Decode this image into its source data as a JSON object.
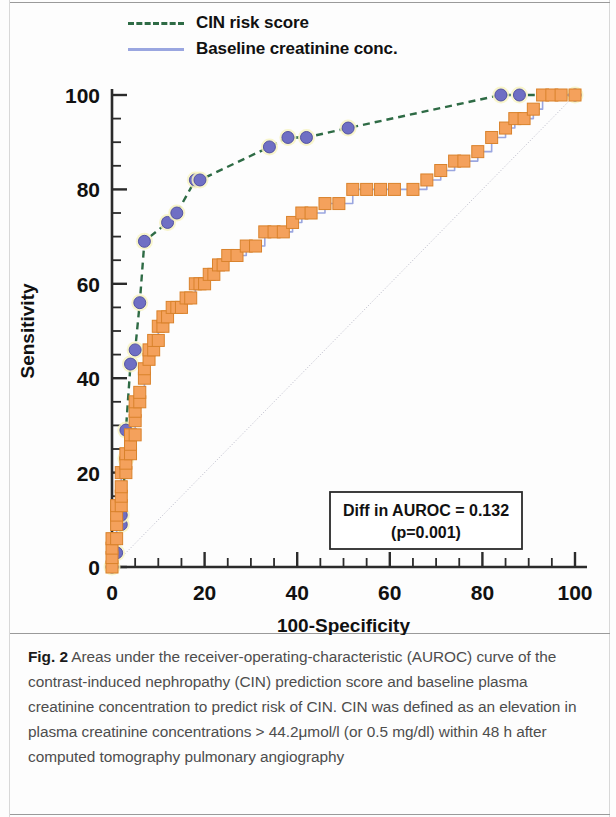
{
  "figure": {
    "label": "Fig. 2",
    "caption": "Areas under the receiver-operating-characteristic (AUROC) curve of the contrast-induced nephropathy (CIN) prediction score and baseline plasma creatinine concentration to predict risk of CIN. CIN was defined as an elevation in plasma creatinine concentrations > 44.2μmol/l (or 0.5 mg/dl) within 48 h after computed tomography pulmonary angiography"
  },
  "legend": {
    "position": "top",
    "entries": [
      {
        "label": "CIN risk score",
        "style": "dashed",
        "color": "#2e6b45",
        "marker": "circle",
        "marker_color": "#6f6fc4"
      },
      {
        "label": "Baseline creatinine conc.",
        "style": "solid",
        "color": "#9aa6e0",
        "marker": "square",
        "marker_color": "#f4a15c"
      }
    ]
  },
  "annotation": {
    "line1": "Diff in AUROC = 0.132",
    "line2": "(p=0.001)"
  },
  "chart_data": {
    "type": "line",
    "title": "",
    "subtitle": "",
    "xlabel": "100-Specificity",
    "ylabel": "Sensitivity",
    "xlim": [
      0,
      100
    ],
    "ylim": [
      0,
      100
    ],
    "xticks": [
      0,
      20,
      40,
      60,
      80,
      100
    ],
    "yticks": [
      0,
      20,
      40,
      60,
      80,
      100
    ],
    "xminor_step": 5,
    "yminor_step": 5,
    "grid": false,
    "reference_line": {
      "from": [
        0,
        0
      ],
      "to": [
        100,
        100
      ],
      "style": "dotted",
      "color": "#b9b9c8"
    },
    "series": [
      {
        "name": "CIN risk score",
        "color": "#2e6b45",
        "line_style": "dashed",
        "marker": "circle",
        "marker_color": "#6f6fc4",
        "marker_halo": "#f7f3c2",
        "points": [
          [
            0,
            0
          ],
          [
            1,
            3
          ],
          [
            2,
            9
          ],
          [
            2,
            11
          ],
          [
            3,
            23
          ],
          [
            3,
            29
          ],
          [
            4,
            43
          ],
          [
            5,
            46
          ],
          [
            6,
            56
          ],
          [
            7,
            69
          ],
          [
            12,
            73
          ],
          [
            14,
            75
          ],
          [
            18,
            82
          ],
          [
            19,
            82
          ],
          [
            34,
            89
          ],
          [
            38,
            91
          ],
          [
            42,
            91
          ],
          [
            51,
            93
          ],
          [
            84,
            100
          ],
          [
            88,
            100
          ],
          [
            100,
            100
          ]
        ]
      },
      {
        "name": "Baseline creatinine conc.",
        "color": "#9aa6e0",
        "line_style": "solid",
        "marker": "square",
        "marker_color": "#f4a15c",
        "points": [
          [
            0,
            0
          ],
          [
            0,
            2
          ],
          [
            0,
            4
          ],
          [
            0,
            6
          ],
          [
            1,
            6
          ],
          [
            1,
            9
          ],
          [
            1,
            11
          ],
          [
            1,
            13
          ],
          [
            2,
            13
          ],
          [
            2,
            15
          ],
          [
            2,
            17
          ],
          [
            2,
            20
          ],
          [
            3,
            20
          ],
          [
            3,
            22
          ],
          [
            3,
            24
          ],
          [
            4,
            24
          ],
          [
            4,
            26
          ],
          [
            4,
            28
          ],
          [
            5,
            28
          ],
          [
            5,
            31
          ],
          [
            5,
            33
          ],
          [
            5,
            35
          ],
          [
            6,
            35
          ],
          [
            6,
            37
          ],
          [
            7,
            40
          ],
          [
            7,
            42
          ],
          [
            8,
            44
          ],
          [
            8,
            46
          ],
          [
            9,
            46
          ],
          [
            9,
            48
          ],
          [
            10,
            48
          ],
          [
            10,
            51
          ],
          [
            11,
            51
          ],
          [
            11,
            53
          ],
          [
            12,
            53
          ],
          [
            13,
            55
          ],
          [
            14,
            55
          ],
          [
            15,
            55
          ],
          [
            16,
            57
          ],
          [
            17,
            57
          ],
          [
            18,
            60
          ],
          [
            19,
            60
          ],
          [
            20,
            60
          ],
          [
            21,
            62
          ],
          [
            22,
            62
          ],
          [
            23,
            64
          ],
          [
            24,
            64
          ],
          [
            25,
            66
          ],
          [
            27,
            66
          ],
          [
            29,
            68
          ],
          [
            31,
            68
          ],
          [
            33,
            71
          ],
          [
            35,
            71
          ],
          [
            37,
            71
          ],
          [
            39,
            73
          ],
          [
            41,
            75
          ],
          [
            43,
            75
          ],
          [
            46,
            77
          ],
          [
            49,
            77
          ],
          [
            52,
            80
          ],
          [
            55,
            80
          ],
          [
            58,
            80
          ],
          [
            61,
            80
          ],
          [
            65,
            80
          ],
          [
            68,
            82
          ],
          [
            71,
            84
          ],
          [
            74,
            86
          ],
          [
            76,
            86
          ],
          [
            79,
            88
          ],
          [
            82,
            91
          ],
          [
            85,
            93
          ],
          [
            87,
            95
          ],
          [
            89,
            95
          ],
          [
            91,
            97
          ],
          [
            93,
            100
          ],
          [
            95,
            100
          ],
          [
            97,
            100
          ],
          [
            100,
            100
          ]
        ]
      }
    ]
  }
}
